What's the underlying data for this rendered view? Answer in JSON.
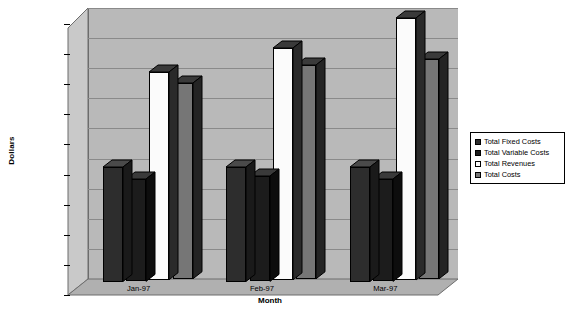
{
  "chart_data": {
    "type": "bar",
    "title": "",
    "xlabel": "Month",
    "ylabel": "Dollars",
    "categories": [
      "Jan-97",
      "Feb-97",
      "Mar-97"
    ],
    "ylim": [
      0,
      45000
    ],
    "ytick_step": 5000,
    "ytick_labels": [
      "$0.00",
      "$5,000.00",
      "$10,000.00",
      "$15,000.00",
      "$20,000.00",
      "$25,000.00",
      "$30,000.00",
      "$35,000.00",
      "$40,000.00",
      "$45,000.00"
    ],
    "ytick_values": [
      0,
      5000,
      10000,
      15000,
      20000,
      25000,
      30000,
      35000,
      40000,
      45000
    ],
    "grid": true,
    "legend_position": "right",
    "style": "3d-column",
    "series": [
      {
        "name": "Total Fixed Costs",
        "color": "#2d2d2d",
        "top_color": "#4a4a4a",
        "side_color": "#1a1a1a",
        "values": [
          19000,
          19000,
          19000
        ]
      },
      {
        "name": "Total Variable Costs",
        "color": "#1c1c1c",
        "top_color": "#3a3a3a",
        "side_color": "#0d0d0d",
        "values": [
          17000,
          17500,
          17000
        ]
      },
      {
        "name": "Total Revenues",
        "color": "#fbfbfb",
        "top_color": "#3a3a3a",
        "side_color": "#2a2a2a",
        "values": [
          34500,
          38500,
          43500
        ]
      },
      {
        "name": "Total Costs",
        "color": "#767676",
        "top_color": "#3a3a3a",
        "side_color": "#242424",
        "values": [
          32500,
          35500,
          36500
        ]
      }
    ]
  },
  "legend": {
    "items": [
      {
        "label": "Total Fixed Costs"
      },
      {
        "label": "Total Variable Costs"
      },
      {
        "label": "Total Revenues"
      },
      {
        "label": "Total Costs"
      }
    ]
  }
}
